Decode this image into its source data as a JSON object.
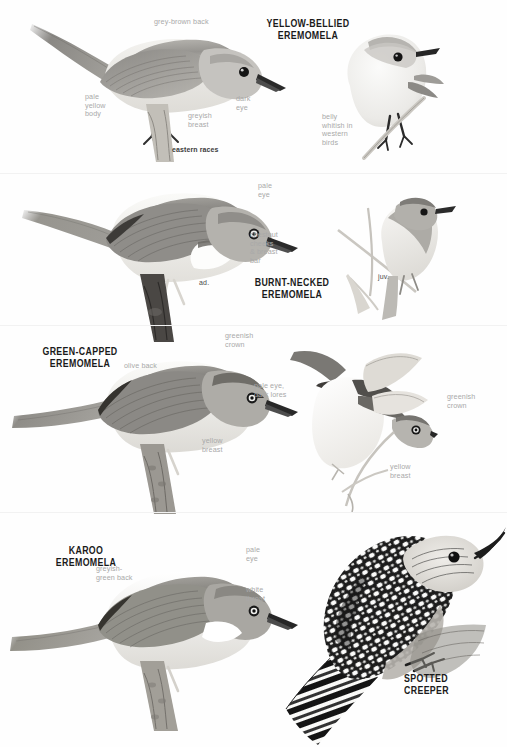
{
  "page": {
    "background": "#ffffff",
    "ink_dark": "#1a1a1a",
    "ink_anno": "#a9a9a9",
    "type": "field-guide-plate"
  },
  "panels": [
    {
      "id": "yellow-bellied-eremomela",
      "title": "YELLOW-BELLIED\nEREMOMELA",
      "annotations": [
        {
          "name": "grey-brown-back",
          "text": "grey-brown back"
        },
        {
          "name": "pale-yellow-body",
          "text": "pale\nyellow\nbody"
        },
        {
          "name": "greyish-breast",
          "text": "greyish\nbreast"
        },
        {
          "name": "dark-eye",
          "text": "dark\neye"
        },
        {
          "name": "eastern-races",
          "text": "eastern races"
        },
        {
          "name": "belly-whitish-western",
          "text": "belly\nwhitish in\nwestern\nbirds"
        }
      ]
    },
    {
      "id": "burnt-necked-eremomela",
      "title": "BURNT-NECKED\nEREMOMELA",
      "annotations": [
        {
          "name": "pale-eye",
          "text": "pale\neye"
        },
        {
          "name": "chestnut-cheeks-breast-bar",
          "text": "chestnut\ncheeks\n& breast\nbar"
        }
      ],
      "ages": [
        {
          "name": "adult",
          "text": "ad."
        },
        {
          "name": "juvenile",
          "text": "juv."
        }
      ]
    },
    {
      "id": "green-capped-eremomela",
      "title": "GREEN-CAPPED\nEREMOMELA",
      "annotations": [
        {
          "name": "greenish-crown",
          "text": "greenish\ncrown"
        },
        {
          "name": "olive-back",
          "text": "olive back"
        },
        {
          "name": "pale-eye-dark-lores",
          "text": "pale eye,\ndark lores"
        },
        {
          "name": "yellow-breast",
          "text": "yellow\nbreast"
        },
        {
          "name": "greenish-crown-2",
          "text": "greenish\ncrown"
        },
        {
          "name": "yellow-breast-2",
          "text": "yellow\nbreast"
        }
      ]
    },
    {
      "id": "karoo-eremomela",
      "title": "KAROO\nEREMOMELA",
      "annotations": [
        {
          "name": "greyish-green-back",
          "text": "greyish-\ngreen back"
        },
        {
          "name": "pale-eye",
          "text": "pale\neye"
        },
        {
          "name": "white-throat",
          "text": "white\nthroat"
        }
      ]
    },
    {
      "id": "spotted-creeper",
      "title": "SPOTTED\nCREEPER",
      "annotations": []
    }
  ]
}
